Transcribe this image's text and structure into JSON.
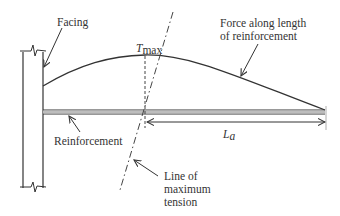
{
  "figure": {
    "labels": {
      "facing": "Facing",
      "force_line1": "Force along length",
      "force_line2": "of reinforcement",
      "tmax_main": "T",
      "tmax_sub": "max",
      "reinforcement": "Reinforcement",
      "la_main": "L",
      "la_sub": "a",
      "max_tension_line1": "Line of",
      "max_tension_line2": "maximum",
      "max_tension_line3": "tension"
    },
    "colors": {
      "ink": "#333333",
      "reinforcement_fill": "#bdbdbd"
    }
  }
}
